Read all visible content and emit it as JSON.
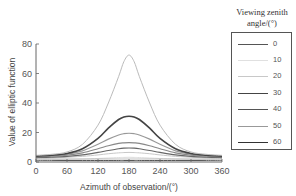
{
  "chart_data": {
    "type": "line",
    "title": "",
    "xlabel": "Azimuth of observation/(°)",
    "ylabel": "Value of elliptic function",
    "xlim": [
      0,
      360
    ],
    "ylim": [
      0,
      80
    ],
    "xticks": [
      0,
      60,
      120,
      180,
      240,
      300,
      360
    ],
    "yticks": [
      0,
      20,
      40,
      60,
      80
    ],
    "grid": false,
    "legend_title": "Viewing zenith angle/(°)",
    "legend_position": "right",
    "x": [
      0,
      30,
      60,
      90,
      120,
      140,
      160,
      170,
      180,
      190,
      200,
      220,
      240,
      270,
      300,
      330,
      360
    ],
    "series": [
      {
        "name": "0",
        "color": "#555555",
        "width": 1.0,
        "values": [
          1,
          1,
          1,
          1,
          1,
          1,
          1,
          1,
          1,
          1,
          1,
          1,
          1,
          1,
          1,
          1,
          1
        ]
      },
      {
        "name": "10",
        "color": "#dddddd",
        "width": 1.0,
        "values": [
          1.5,
          1.6,
          1.8,
          2.0,
          2.4,
          2.7,
          3.0,
          3.1,
          3.2,
          3.1,
          3.0,
          2.7,
          2.4,
          2.0,
          1.8,
          1.6,
          1.5
        ]
      },
      {
        "name": "20",
        "color": "#c8c8c8",
        "width": 1.0,
        "values": [
          2.5,
          2.8,
          3.2,
          3.8,
          4.8,
          5.6,
          6.2,
          6.4,
          6.5,
          6.4,
          6.2,
          5.6,
          4.8,
          3.8,
          3.2,
          2.8,
          2.5
        ]
      },
      {
        "name": "30",
        "color": "#666666",
        "width": 1.2,
        "values": [
          3.0,
          3.3,
          3.8,
          4.8,
          6.5,
          7.8,
          9.0,
          9.4,
          9.5,
          9.4,
          9.0,
          7.8,
          6.5,
          4.8,
          3.8,
          3.3,
          3.0
        ]
      },
      {
        "name": "40",
        "color": "#888888",
        "width": 1.2,
        "values": [
          3.5,
          3.9,
          4.6,
          6.2,
          9.0,
          11.0,
          12.6,
          13.0,
          13.2,
          13.0,
          12.6,
          11.0,
          9.0,
          6.2,
          4.6,
          3.9,
          3.5
        ]
      },
      {
        "name": "50",
        "color": "#999999",
        "width": 1.2,
        "values": [
          3.8,
          4.3,
          5.2,
          7.5,
          12.0,
          15.5,
          18.3,
          19.2,
          19.5,
          19.2,
          18.3,
          15.5,
          12.0,
          7.5,
          5.2,
          4.3,
          3.8
        ]
      },
      {
        "name": "60",
        "color": "#444444",
        "width": 1.6,
        "values": [
          4.0,
          4.6,
          5.8,
          9.0,
          16.0,
          23.0,
          28.8,
          30.5,
          31.0,
          30.5,
          28.8,
          23.0,
          16.0,
          9.0,
          5.8,
          4.6,
          4.0
        ]
      },
      {
        "name": "70",
        "color": "#bbbbbb",
        "width": 1.0,
        "values": [
          4.5,
          5.2,
          6.8,
          12.0,
          25.0,
          40.0,
          58.0,
          68.0,
          72.5,
          68.0,
          58.0,
          40.0,
          25.0,
          12.0,
          6.8,
          5.2,
          4.5
        ]
      }
    ]
  },
  "legend": {
    "title_line1": "Viewing zenith",
    "title_line2": "angle/(°)",
    "items": [
      {
        "label": "0",
        "color": "#555555"
      },
      {
        "label": "10",
        "color": "#e0e0e0"
      },
      {
        "label": "20",
        "color": "#c8c8c8"
      },
      {
        "label": "30",
        "color": "#444444"
      },
      {
        "label": "40",
        "color": "#555555"
      },
      {
        "label": "50",
        "color": "#999999"
      },
      {
        "label": "60",
        "color": "#333333"
      }
    ]
  },
  "axes": {
    "ylabel": "Value of elliptic function",
    "xlabel": "Azimuth of observation/(°)",
    "yticks": [
      "0",
      "20",
      "40",
      "60",
      "80"
    ],
    "xticks": [
      "0",
      "60",
      "120",
      "180",
      "240",
      "300",
      "360"
    ]
  }
}
